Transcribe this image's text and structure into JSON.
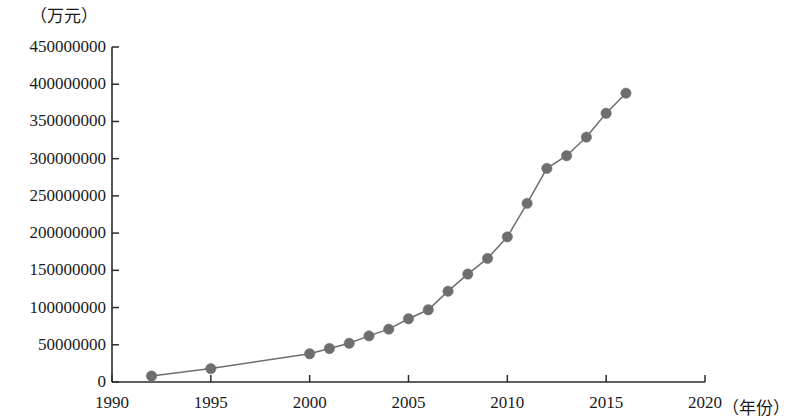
{
  "chart_data": {
    "type": "line",
    "title": "",
    "subtitle": "",
    "xlabel": "（年份）",
    "ylabel": "（万元）",
    "xlim": [
      1990,
      2020
    ],
    "ylim": [
      0,
      450000000
    ],
    "grid": false,
    "legend": null,
    "marker": "filled-circle",
    "series_color": "#6e6e6e",
    "line_color": "#6e6e6e",
    "axis_color": "#2b2b2b",
    "x_ticks": [
      1990,
      1995,
      2000,
      2005,
      2010,
      2015,
      2020
    ],
    "x_tick_labels": [
      "1990",
      "1995",
      "2000",
      "2005",
      "2010",
      "2015",
      "2020"
    ],
    "y_ticks": [
      0,
      50000000,
      100000000,
      150000000,
      200000000,
      250000000,
      300000000,
      350000000,
      400000000,
      450000000
    ],
    "y_tick_labels": [
      "0",
      "50000000",
      "100000000",
      "150000000",
      "200000000",
      "250000000",
      "300000000",
      "350000000",
      "400000000",
      "450000000"
    ],
    "series": [
      {
        "name": "",
        "x": [
          1992,
          1995,
          2000,
          2001,
          2002,
          2003,
          2004,
          2005,
          2006,
          2007,
          2008,
          2009,
          2010,
          2011,
          2012,
          2013,
          2014,
          2015,
          2016
        ],
        "values": [
          8000000,
          18000000,
          38000000,
          45000000,
          52000000,
          62000000,
          71000000,
          85000000,
          97000000,
          122000000,
          145000000,
          166000000,
          195000000,
          240000000,
          287000000,
          304000000,
          329000000,
          361000000,
          388000000
        ]
      }
    ]
  }
}
